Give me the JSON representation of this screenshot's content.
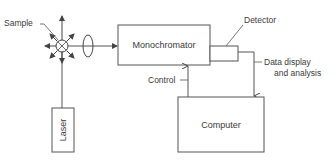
{
  "diagram": {
    "components": {
      "sample": {
        "label": "Sample"
      },
      "laser": {
        "label": "Laser"
      },
      "monochromator": {
        "label": "Monochromator"
      },
      "detector": {
        "label": "Detector"
      },
      "computer": {
        "label": "Computer"
      }
    },
    "connections": {
      "control": {
        "label": "Control"
      },
      "data": {
        "line1": "Data display",
        "line2": "and analysis"
      }
    },
    "colors": {
      "stroke": "#555555",
      "text": "#3a3a3a",
      "background": "#ffffff"
    }
  }
}
